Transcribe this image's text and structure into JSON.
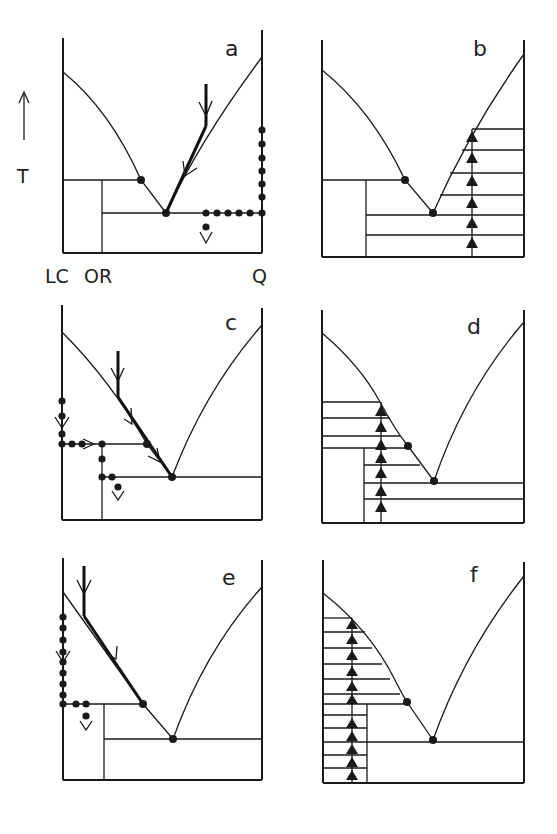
{
  "figure": {
    "axis_label_T": "T",
    "axis_arrow": "up-arrow",
    "composition_labels": {
      "left": "LC",
      "middle": "OR",
      "right": "Q"
    }
  },
  "panels": [
    {
      "id": "a",
      "label": "a",
      "description": "Equilibrium crystallization path starting in quartz field; liquid path (solid arrows) along quartz liquidus to eutectic; bulk solid composition path (dotted) down Q axis then toward eutectic composition"
    },
    {
      "id": "b",
      "label": "b",
      "description": "Quartz field with horizontal tie lines; upward triangle markers in a column at fixed composition"
    },
    {
      "id": "c",
      "label": "c",
      "description": "Crystallization path starting in LC field; liquid path descends along LC liquidus to peritectic then eutectic; dotted solid path along LC axis then to OR then toward eutectic"
    },
    {
      "id": "d",
      "label": "d",
      "description": "LC/OR field with horizontal tie lines; upward triangle column"
    },
    {
      "id": "e",
      "label": "e",
      "description": "Crystallization path ending at peritectic; dotted solid path down LC axis then to OR composition"
    },
    {
      "id": "f",
      "label": "f",
      "description": "LC field with many horizontal tie lines; upward triangle column reaching liquidus"
    }
  ],
  "legend": {
    "filled_dot": "invariant point / solid composition",
    "thick_arrow": "liquid path",
    "dotted_path": "bulk solid path",
    "triangle": "heating/temperature step marker"
  }
}
